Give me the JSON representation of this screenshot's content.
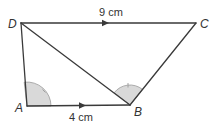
{
  "diagram": {
    "colors": {
      "line": "#3a3a3a",
      "angle_fill": "#d9d9d9",
      "angle_stroke": "#9a9a9a",
      "text": "#333333"
    },
    "vertices": {
      "A": {
        "label": "A",
        "x": 27,
        "y": 106,
        "label_x": 15,
        "label_y": 112
      },
      "B": {
        "label": "B",
        "x": 130,
        "y": 105,
        "label_x": 134,
        "label_y": 116
      },
      "C": {
        "label": "C",
        "x": 196,
        "y": 23,
        "label_x": 200,
        "label_y": 28
      },
      "D": {
        "label": "D",
        "x": 21,
        "y": 23,
        "label_x": 8,
        "label_y": 28
      }
    },
    "edges": [
      {
        "from": "D",
        "to": "C"
      },
      {
        "from": "A",
        "to": "B"
      },
      {
        "from": "D",
        "to": "A"
      },
      {
        "from": "B",
        "to": "C"
      },
      {
        "from": "D",
        "to": "B"
      }
    ],
    "lengths": {
      "DC": {
        "text": "9 cm",
        "x": 99,
        "y": 16
      },
      "AB": {
        "text": "4 cm",
        "x": 69,
        "y": 121
      }
    },
    "parallel_arrows": [
      {
        "edge": "DC",
        "x": 106,
        "y": 23
      },
      {
        "edge": "AB",
        "x": 83,
        "y": 105.5
      }
    ],
    "angle_marks": [
      {
        "vertex": "A",
        "note": "angle DAB, single tick"
      },
      {
        "vertex": "B",
        "note": "angle DBC, single tick"
      }
    ]
  }
}
